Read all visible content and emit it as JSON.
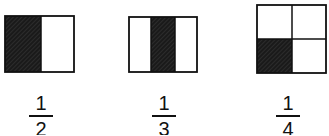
{
  "figures": [
    {
      "id": "half",
      "shape": "rectangle",
      "parts": 2,
      "layout": "vertical-strips",
      "shaded_parts": [
        0
      ],
      "fraction": {
        "numerator": "1",
        "denominator": "2"
      }
    },
    {
      "id": "third",
      "shape": "rectangle",
      "parts": 3,
      "layout": "vertical-strips",
      "shaded_parts": [
        1
      ],
      "fraction": {
        "numerator": "1",
        "denominator": "3"
      }
    },
    {
      "id": "quarter",
      "shape": "square",
      "parts": 4,
      "layout": "2x2-grid",
      "shaded_parts": [
        2
      ],
      "fraction": {
        "numerator": "1",
        "denominator": "4"
      }
    }
  ],
  "colors": {
    "shade": "#1a1a1a",
    "stroke": "#111111",
    "background": "#ffffff"
  }
}
